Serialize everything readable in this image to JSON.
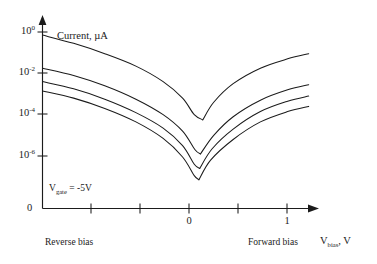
{
  "chart_data": {
    "type": "line",
    "title": "",
    "ylabel": "Current, µA",
    "xlabel": "V<sub>bias</sub>, V",
    "xlabel_text": "Vbias, V",
    "yscale": "log",
    "xscale": "linear",
    "grid": false,
    "legend": null,
    "xlim": [
      -2.0,
      1.45
    ],
    "ylim_exponents": [
      -7.4,
      0.35
    ],
    "y_tick_labels": [
      "10^0",
      "10^-2",
      "10^-4",
      "10^-6"
    ],
    "y_tick_exponents": [
      0,
      -2,
      -4,
      -6
    ],
    "y_origin_label": "0",
    "x_tick_labels": [
      "",
      "",
      "0",
      "",
      "1"
    ],
    "x_tick_values": [
      -1.5,
      -0.75,
      0,
      0.6,
      1.15
    ],
    "x_labeled_ticks": [
      {
        "value": 0,
        "label": "0"
      },
      {
        "value": 1,
        "label": "1"
      }
    ],
    "annotations": [
      {
        "name": "gate-voltage",
        "text": "Vgate = -5V",
        "html": "V<sub>gate</sub> = -5V",
        "x": -1.45,
        "y_exponent": -6.9
      },
      {
        "name": "reverse-bias",
        "text": "Reverse bias",
        "x": -1.3
      },
      {
        "name": "forward-bias",
        "text": "Forward bias",
        "x": 1.0
      }
    ],
    "series": [
      {
        "name": "curve-1",
        "label": "",
        "points": [
          {
            "x": -2.0,
            "y_exponent": -0.15
          },
          {
            "x": -1.6,
            "y_exponent": -0.55
          },
          {
            "x": -1.2,
            "y_exponent": -1.05
          },
          {
            "x": -0.8,
            "y_exponent": -1.65
          },
          {
            "x": -0.45,
            "y_exponent": -2.4
          },
          {
            "x": -0.2,
            "y_exponent": -3.2
          },
          {
            "x": -0.05,
            "y_exponent": -4.0
          },
          {
            "x": 0.06,
            "y_exponent": -4.25
          },
          {
            "x": 0.2,
            "y_exponent": -3.4
          },
          {
            "x": 0.45,
            "y_exponent": -2.5
          },
          {
            "x": 0.8,
            "y_exponent": -1.75
          },
          {
            "x": 1.15,
            "y_exponent": -1.3
          },
          {
            "x": 1.42,
            "y_exponent": -1.05
          }
        ]
      },
      {
        "name": "curve-2",
        "label": "",
        "points": [
          {
            "x": -2.0,
            "y_exponent": -1.75
          },
          {
            "x": -1.6,
            "y_exponent": -2.1
          },
          {
            "x": -1.2,
            "y_exponent": -2.6
          },
          {
            "x": -0.8,
            "y_exponent": -3.25
          },
          {
            "x": -0.45,
            "y_exponent": -4.0
          },
          {
            "x": -0.2,
            "y_exponent": -4.8
          },
          {
            "x": -0.04,
            "y_exponent": -5.7
          },
          {
            "x": 0.03,
            "y_exponent": -5.9
          },
          {
            "x": 0.2,
            "y_exponent": -5.0
          },
          {
            "x": 0.45,
            "y_exponent": -4.1
          },
          {
            "x": 0.8,
            "y_exponent": -3.3
          },
          {
            "x": 1.15,
            "y_exponent": -2.8
          },
          {
            "x": 1.42,
            "y_exponent": -2.55
          }
        ]
      },
      {
        "name": "curve-3",
        "label": "",
        "points": [
          {
            "x": -2.0,
            "y_exponent": -2.4
          },
          {
            "x": -1.6,
            "y_exponent": -2.75
          },
          {
            "x": -1.2,
            "y_exponent": -3.25
          },
          {
            "x": -0.8,
            "y_exponent": -3.9
          },
          {
            "x": -0.45,
            "y_exponent": -4.65
          },
          {
            "x": -0.2,
            "y_exponent": -5.5
          },
          {
            "x": -0.05,
            "y_exponent": -6.4
          },
          {
            "x": 0.02,
            "y_exponent": -6.6
          },
          {
            "x": 0.18,
            "y_exponent": -5.65
          },
          {
            "x": 0.45,
            "y_exponent": -4.7
          },
          {
            "x": 0.8,
            "y_exponent": -3.85
          },
          {
            "x": 1.15,
            "y_exponent": -3.35
          },
          {
            "x": 1.42,
            "y_exponent": -3.1
          }
        ]
      },
      {
        "name": "curve-4",
        "label": "",
        "points": [
          {
            "x": -2.0,
            "y_exponent": -2.85
          },
          {
            "x": -1.6,
            "y_exponent": -3.2
          },
          {
            "x": -1.2,
            "y_exponent": -3.7
          },
          {
            "x": -0.8,
            "y_exponent": -4.35
          },
          {
            "x": -0.45,
            "y_exponent": -5.15
          },
          {
            "x": -0.2,
            "y_exponent": -6.05
          },
          {
            "x": -0.05,
            "y_exponent": -6.95
          },
          {
            "x": 0.01,
            "y_exponent": -7.15
          },
          {
            "x": 0.16,
            "y_exponent": -6.2
          },
          {
            "x": 0.45,
            "y_exponent": -5.2
          },
          {
            "x": 0.8,
            "y_exponent": -4.35
          },
          {
            "x": 1.15,
            "y_exponent": -3.85
          },
          {
            "x": 1.42,
            "y_exponent": -3.6
          }
        ]
      }
    ],
    "colors": {
      "axis": "#1b1b1b",
      "curve": "#1b1b1b",
      "background": "#ffffff"
    }
  }
}
